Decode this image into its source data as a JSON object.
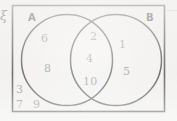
{
  "diagram": {
    "type": "venn",
    "universal_set_symbol": "ξ",
    "sets": [
      {
        "name": "A",
        "label": "A"
      },
      {
        "name": "B",
        "label": "B"
      }
    ],
    "regions": [
      {
        "name": "A-only",
        "elements": [
          "6",
          "8"
        ]
      },
      {
        "name": "A-intersect-B",
        "elements": [
          "2",
          "4",
          "10"
        ]
      },
      {
        "name": "B-only",
        "elements": [
          "1",
          "5"
        ]
      },
      {
        "name": "outside",
        "elements": [
          "3",
          "7",
          "9"
        ]
      }
    ],
    "elements": {
      "a_only_1": "6",
      "a_only_2": "8",
      "intersection_1": "2",
      "intersection_2": "4",
      "intersection_3": "10",
      "b_only_1": "1",
      "b_only_2": "5",
      "outside_1": "3",
      "outside_2": "7",
      "outside_3": "9"
    },
    "colors": {
      "background": "#f4f3f1",
      "outline": "#2e2e2e",
      "element_text": "#7b7b7b",
      "set_label_text": "#2b2b2b"
    }
  }
}
